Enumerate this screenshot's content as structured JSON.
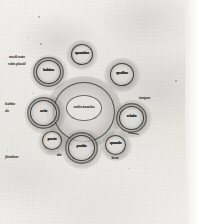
{
  "image": {
    "kind": "manuscript-folio-photograph",
    "description": "Medieval parchment folio with an ink circle diagram",
    "palette": {
      "parchment": "#eceae6",
      "ink": "#2b2823",
      "smudge": "#5f5c56",
      "margin": "#ffffff"
    }
  },
  "diagram": {
    "center": {
      "label": "substantia",
      "has_inner_ring": true
    },
    "nodes": [
      {
        "id": "n-top",
        "label": "quantitas",
        "double_ring": false
      },
      {
        "id": "n-upper-right",
        "label": "qualitas",
        "double_ring": false
      },
      {
        "id": "n-right",
        "label": "relatio",
        "double_ring": true
      },
      {
        "id": "n-lower-right",
        "label": "quando",
        "double_ring": false
      },
      {
        "id": "n-bottom",
        "label": "positio",
        "double_ring": true
      },
      {
        "id": "n-lower-left",
        "label": "passio",
        "double_ring": false
      },
      {
        "id": "n-left",
        "label": "actio",
        "double_ring": true
      },
      {
        "id": "n-upper-left",
        "label": "habitus",
        "double_ring": true
      }
    ],
    "node_sublabels": [
      {
        "for": "n-lower-right",
        "text": "locus"
      },
      {
        "for": "n-lower-left",
        "text": "ubi"
      }
    ],
    "margin_notes": [
      {
        "id": "note-upper-left",
        "line1": "modi natu",
        "line2": "rales placid"
      },
      {
        "id": "note-mid-left",
        "line1": "habitu",
        "line2": "do"
      },
      {
        "id": "note-lower-left",
        "line1": "fiendum",
        "line2": ""
      },
      {
        "id": "note-right",
        "line1": "tempus",
        "line2": ""
      }
    ]
  }
}
